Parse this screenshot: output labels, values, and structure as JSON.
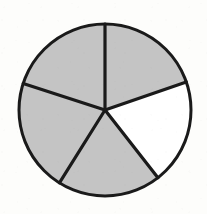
{
  "figure": {
    "kind": "fraction-circle-diagram",
    "background_color": "#fdfdfb",
    "outline_color": "#1a1a1a",
    "shaded_color": "#c4c4c4",
    "unshaded_color": "#ffffff",
    "outline_width_px": 3,
    "divider_width_px": 3.2,
    "center": {
      "x": 105,
      "y": 110
    },
    "radius": 86
  },
  "chart_data": {
    "type": "pie",
    "categories": [
      "Sector 1",
      "Sector 2",
      "Sector 3",
      "Sector 4",
      "Sector 5"
    ],
    "values": [
      1,
      1,
      1,
      1,
      1
    ],
    "total_parts": 5,
    "shaded_parts": 4,
    "unshaded_parts": 1,
    "fraction_shaded": "4/5",
    "legend": "none",
    "grid": false,
    "sectors": [
      {
        "name": "upper-right-shaded",
        "start_angle_deg": 270,
        "end_angle_deg": 341,
        "sweep_deg": 71,
        "shaded": true,
        "fill": "#c4c4c4"
      },
      {
        "name": "right-unshaded",
        "start_angle_deg": 341,
        "end_angle_deg": 52,
        "sweep_deg": 71,
        "shaded": false,
        "fill": "#ffffff"
      },
      {
        "name": "bottom-right-shaded",
        "start_angle_deg": 52,
        "end_angle_deg": 122,
        "sweep_deg": 70,
        "shaded": true,
        "fill": "#c4c4c4"
      },
      {
        "name": "bottom-left-shaded",
        "start_angle_deg": 122,
        "end_angle_deg": 198,
        "sweep_deg": 76,
        "shaded": true,
        "fill": "#c4c4c4"
      },
      {
        "name": "upper-left-shaded",
        "start_angle_deg": 198,
        "end_angle_deg": 270,
        "sweep_deg": 72,
        "shaded": true,
        "fill": "#c4c4c4"
      }
    ],
    "dividers": [
      {
        "name": "divider-top",
        "angle_deg": 270,
        "to_x": 105,
        "to_y": 24
      },
      {
        "name": "divider-upper-right",
        "angle_deg": 341,
        "to_x": 186,
        "to_y": 82
      },
      {
        "name": "divider-lower-right",
        "angle_deg": 52,
        "to_x": 158,
        "to_y": 178
      },
      {
        "name": "divider-lower-left",
        "angle_deg": 122,
        "to_x": 59,
        "to_y": 183
      },
      {
        "name": "divider-upper-left",
        "angle_deg": 198,
        "to_x": 23,
        "to_y": 83
      }
    ]
  }
}
